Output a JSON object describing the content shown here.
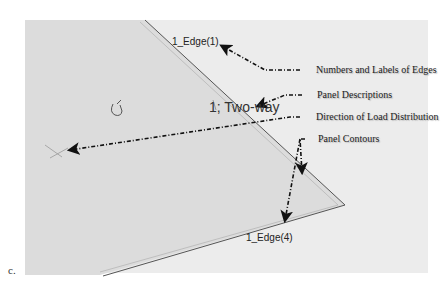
{
  "figure": {
    "tag": "c.",
    "background_color": "#ececec",
    "panel_fill": "#dcdcdc",
    "outline_color": "#555555"
  },
  "panel": {
    "edge_top_label": "1_Edge(1)",
    "edge_bottom_label": "1_Edge(4)",
    "description": "1; Two-way"
  },
  "callouts": [
    {
      "label": "Numbers and Labels of Edges"
    },
    {
      "label": "Panel Descriptions"
    },
    {
      "label": "Direction of Load Distribution"
    },
    {
      "label": "Panel Contours"
    }
  ],
  "icons": {
    "cursor": "hand-cursor-icon",
    "load_direction": "load-direction-cross-icon"
  }
}
